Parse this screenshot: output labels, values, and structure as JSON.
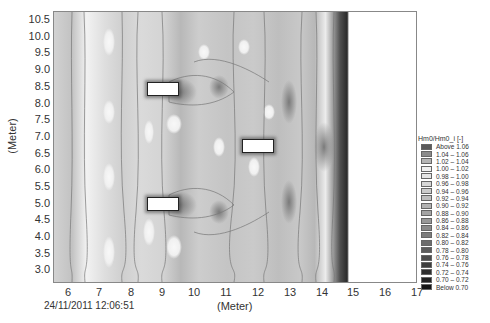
{
  "chart_data": {
    "type": "heatmap",
    "title": "",
    "xlabel": "(Meter)",
    "ylabel": "(Meter)",
    "xlim": [
      5.6,
      17
    ],
    "ylim": [
      2.7,
      10.8
    ],
    "x_ticks": [
      "6",
      "7",
      "8",
      "9",
      "10",
      "11",
      "12",
      "13",
      "14",
      "15",
      "16",
      "17"
    ],
    "y_ticks": [
      "10.5",
      "10.0",
      "9.5",
      "9.0",
      "8.5",
      "8.0",
      "7.5",
      "7.0",
      "6.5",
      "6.0",
      "5.5",
      "5.0",
      "4.5",
      "4.0",
      "3.5",
      "3.0"
    ],
    "grid": false,
    "legend_position": "right",
    "colorbar": {
      "title": "Hm0/Hm0_i [-]",
      "bins": [
        {
          "label": "Above 1.06",
          "color": "#5a5a5a"
        },
        {
          "label": "1.04 – 1.06",
          "color": "#8a8a8a"
        },
        {
          "label": "1.02 – 1.04",
          "color": "#b4b4b4"
        },
        {
          "label": "1.00 – 1.02",
          "color": "#f0f0f0"
        },
        {
          "label": "0.98 – 1.00",
          "color": "#e4e4e4"
        },
        {
          "label": "0.96 – 0.98",
          "color": "#d6d6d6"
        },
        {
          "label": "0.94 – 0.96",
          "color": "#cbcbcb"
        },
        {
          "label": "0.92 – 0.94",
          "color": "#bebebe"
        },
        {
          "label": "0.90 – 0.92",
          "color": "#b2b2b2"
        },
        {
          "label": "0.88 – 0.90",
          "color": "#a5a5a5"
        },
        {
          "label": "0.86 – 0.88",
          "color": "#999999"
        },
        {
          "label": "0.84 – 0.86",
          "color": "#8b8b8b"
        },
        {
          "label": "0.82 – 0.84",
          "color": "#7c7c7c"
        },
        {
          "label": "0.80 – 0.82",
          "color": "#6c6c6c"
        },
        {
          "label": "0.78 – 0.80",
          "color": "#5c5c5c"
        },
        {
          "label": "0.76 – 0.78",
          "color": "#4c4c4c"
        },
        {
          "label": "0.74 – 0.76",
          "color": "#3d3d3d"
        },
        {
          "label": "0.72 – 0.74",
          "color": "#2f2f2f"
        },
        {
          "label": "0.70 – 0.72",
          "color": "#222222"
        },
        {
          "label": "Below 0.70",
          "color": "#141414"
        }
      ]
    },
    "structures": [
      {
        "name": "block-upper-left",
        "x": [
          8.5,
          9.5
        ],
        "y": [
          8.35,
          8.7
        ]
      },
      {
        "name": "block-lower-left",
        "x": [
          8.5,
          9.5
        ],
        "y": [
          4.85,
          5.2
        ]
      },
      {
        "name": "block-right",
        "x": [
          11.5,
          12.5
        ],
        "y": [
          6.6,
          6.95
        ]
      }
    ],
    "domain_x_extent": [
      5.6,
      14.0
    ],
    "contour_labels": [
      "1.02",
      "1",
      "0.98",
      "0.96",
      "0.94",
      "0.92",
      "0.9"
    ]
  },
  "footer": {
    "timestamp": "24/11/2011 12:06:51"
  }
}
